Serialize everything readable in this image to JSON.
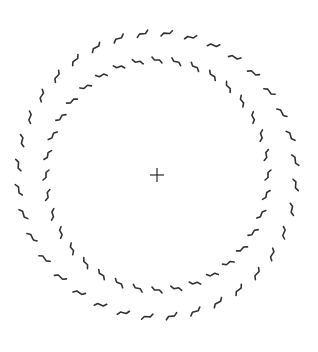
{
  "canvas": {
    "width": 318,
    "height": 352,
    "background": "#ffffff"
  },
  "stimulus": {
    "center": {
      "x": 157,
      "y": 175
    },
    "fixation_cross": {
      "size": 14,
      "stroke_width": 1.2,
      "color": "#2a2a2a"
    },
    "rings": [
      {
        "name": "outer-ring",
        "rx": 139,
        "ry": 142,
        "segments": 36,
        "segment_length": 11,
        "hook": 3,
        "twist": 1,
        "stroke_width": 1.6,
        "color": "#333333",
        "phase_deg": 4
      },
      {
        "name": "inner-ring",
        "rx": 111,
        "ry": 115,
        "segments": 36,
        "segment_length": 10,
        "hook": 3,
        "twist": -1,
        "stroke_width": 1.6,
        "color": "#333333",
        "phase_deg": 0
      }
    ]
  }
}
